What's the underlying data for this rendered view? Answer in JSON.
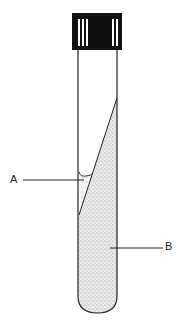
{
  "diagram": {
    "labels": [
      {
        "id": "A",
        "text": "A",
        "points_to": "liquid at base of slant"
      },
      {
        "id": "B",
        "text": "B",
        "points_to": "solid medium (butt)"
      }
    ],
    "colors": {
      "outline": "#222222",
      "cap": "#111111",
      "medium_stipple": "#bdbdbd",
      "background": "#ffffff"
    }
  }
}
